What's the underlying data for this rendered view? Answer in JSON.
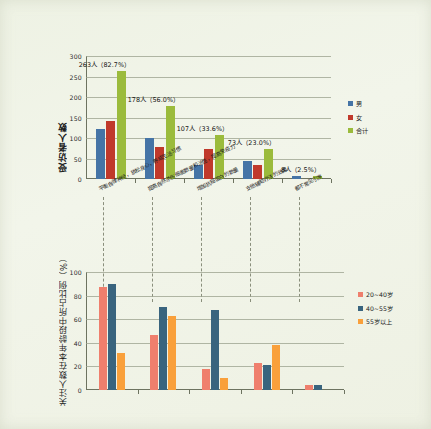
{
  "page": {
    "background": "#f0f3e6"
  },
  "chart_data": [
    {
      "id": "top",
      "type": "bar",
      "title": "",
      "xlabel": "",
      "ylabel": "受访者人数",
      "ylim": [
        0,
        300
      ],
      "yticks": [
        0,
        50,
        100,
        150,
        200,
        250,
        300
      ],
      "grid": true,
      "legend_position": "right",
      "categories": [
        "平衡自律神经，放松身心，养成生活习惯",
        "提高自然杀伤细胞数量和活性，提高免疫力",
        "增加抗癌蛋白的数量",
        "支他辅助疗法的效果",
        "都不常见引发"
      ],
      "series": [
        {
          "name": "男",
          "color": "#4574a6",
          "values": [
            122,
            100,
            35,
            43,
            8
          ]
        },
        {
          "name": "女",
          "color": "#c0392b",
          "values": [
            141,
            79,
            74,
            34,
            0
          ]
        },
        {
          "name": "合计",
          "color": "#9bbb3c",
          "values": [
            263,
            178,
            107,
            73,
            8
          ]
        }
      ],
      "annotations": [
        "263人（82.7%）",
        "178人（56.0%）",
        "107人（33.6%）",
        "73人（23.0%）",
        "8人（2.5%）"
      ]
    },
    {
      "id": "bottom",
      "type": "bar",
      "title": "",
      "xlabel": "",
      "ylabel": "关注人数在本年龄段中所占比例（%）",
      "ylim": [
        0,
        100
      ],
      "yticks": [
        0,
        20,
        40,
        60,
        80,
        100
      ],
      "grid": true,
      "legend_position": "right",
      "categories": [
        "平衡自律神经，放松身心，养成生活习惯",
        "提高自然杀伤细胞数量和活性，提高免疫力",
        "增加抗癌蛋白的数量",
        "支他辅助疗法的效果",
        "都不常见引发"
      ],
      "series": [
        {
          "name": "20~40岁",
          "color": "#ef7f6d",
          "values": [
            87,
            47,
            18,
            23,
            4
          ]
        },
        {
          "name": "40~55岁",
          "color": "#39647e",
          "values": [
            90,
            70,
            68,
            21,
            4
          ]
        },
        {
          "name": "55岁以上",
          "color": "#f9a03b",
          "values": [
            31,
            63,
            10,
            38,
            0
          ]
        }
      ],
      "annotations": []
    }
  ]
}
